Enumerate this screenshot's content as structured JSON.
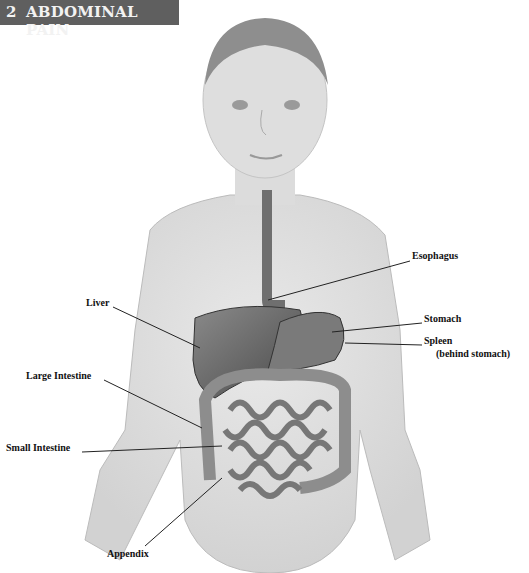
{
  "header": {
    "number": "2",
    "title": "ABDOMINAL PAIN",
    "background": "#5f5f5f",
    "text_color": "#f2f2f2"
  },
  "figure": {
    "labels": [
      {
        "id": "esophagus",
        "text": "Esophagus",
        "x": 412,
        "y": 255
      },
      {
        "id": "liver",
        "text": "Liver",
        "x": 86,
        "y": 302
      },
      {
        "id": "stomach",
        "text": "Stomach",
        "x": 424,
        "y": 318
      },
      {
        "id": "spleen",
        "text": "Spleen",
        "x": 424,
        "y": 340
      },
      {
        "id": "spleen-note",
        "text": "(behind stomach)",
        "x": 436,
        "y": 352
      },
      {
        "id": "large-intestine",
        "text": "Large Intestine",
        "x": 26,
        "y": 375
      },
      {
        "id": "small-intestine",
        "text": "Small Intestine",
        "x": 6,
        "y": 447
      },
      {
        "id": "appendix",
        "text": "Appendix",
        "x": 107,
        "y": 553
      }
    ]
  }
}
